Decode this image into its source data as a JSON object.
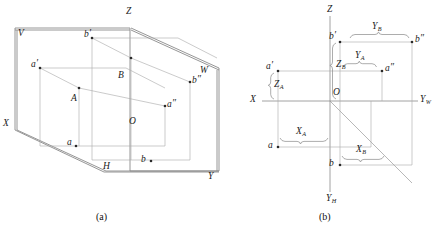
{
  "figure": {
    "background_color": "#ffffff",
    "line_color": "#8c8c8c",
    "dark_line_color": "#555555",
    "text_color": "#1a1a1a"
  },
  "panel_a": {
    "caption": "(a)",
    "description": "Three-dimensional pictorial view of the three projection planes V, H, W with space points A and B and their projections",
    "plane_labels": [
      {
        "name": "plane-label-v",
        "text": "V"
      },
      {
        "name": "plane-label-h",
        "text": "H"
      },
      {
        "name": "plane-label-w",
        "text": "W"
      }
    ],
    "axis_labels": [
      {
        "name": "axis-label-z",
        "text": "Z"
      },
      {
        "name": "axis-label-x",
        "text": "X"
      },
      {
        "name": "axis-label-y",
        "text": "Y"
      },
      {
        "name": "origin-label-o",
        "text": "O"
      }
    ],
    "point_labels": [
      {
        "name": "point-a-front",
        "base": "a",
        "prime": "′"
      },
      {
        "name": "point-b-front",
        "base": "b",
        "prime": "′"
      },
      {
        "name": "point-a-space",
        "base": "A",
        "prime": ""
      },
      {
        "name": "point-b-space",
        "base": "B",
        "prime": ""
      },
      {
        "name": "point-a-top",
        "base": "a",
        "prime": ""
      },
      {
        "name": "point-b-top",
        "base": "b",
        "prime": ""
      },
      {
        "name": "point-a-side",
        "base": "a",
        "prime": "″"
      },
      {
        "name": "point-b-side",
        "base": "b",
        "prime": "″"
      }
    ]
  },
  "panel_b": {
    "caption": "(b)",
    "description": "Unfolded two-dimensional projection drawing with coordinate dimension braces",
    "axis_labels": [
      {
        "name": "axis-label-z",
        "text": "Z",
        "sub": ""
      },
      {
        "name": "axis-label-x",
        "text": "X",
        "sub": ""
      },
      {
        "name": "axis-label-yw",
        "text": "Y",
        "sub": "W"
      },
      {
        "name": "axis-label-yh",
        "text": "Y",
        "sub": "H"
      },
      {
        "name": "origin-label-o",
        "text": "O",
        "sub": ""
      }
    ],
    "point_labels": [
      {
        "name": "point-a-front",
        "base": "a",
        "prime": "′"
      },
      {
        "name": "point-b-front",
        "base": "b",
        "prime": "′"
      },
      {
        "name": "point-a-side",
        "base": "a",
        "prime": "″"
      },
      {
        "name": "point-b-side",
        "base": "b",
        "prime": "″"
      },
      {
        "name": "point-a-top",
        "base": "a",
        "prime": ""
      },
      {
        "name": "point-b-top",
        "base": "b",
        "prime": ""
      }
    ],
    "dimension_labels": [
      {
        "name": "dimension-y-b",
        "base": "Y",
        "sub": "B"
      },
      {
        "name": "dimension-y-a",
        "base": "Y",
        "sub": "A"
      },
      {
        "name": "dimension-z-b",
        "base": "Z",
        "sub": "B"
      },
      {
        "name": "dimension-z-a",
        "base": "Z",
        "sub": "A"
      },
      {
        "name": "dimension-x-a",
        "base": "X",
        "sub": "A"
      },
      {
        "name": "dimension-x-b",
        "base": "X",
        "sub": "B"
      }
    ]
  }
}
